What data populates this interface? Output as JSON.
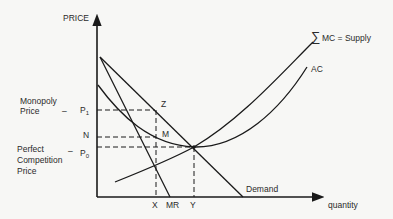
{
  "axes": {
    "y_label": "PRICE",
    "x_label": "quantity"
  },
  "price_labels": {
    "monopoly_line1": "Monopoly",
    "monopoly_line2": "Price",
    "p1": "P",
    "p1_sub": "1",
    "n": "N",
    "perfect_line1": "Perfect",
    "perfect_line2": "Competition",
    "perfect_line3": "Price",
    "p0": "P",
    "p0_sub": "0",
    "dash": "–"
  },
  "point_labels": {
    "z": "Z",
    "m": "M"
  },
  "quantity_labels": {
    "x": "X",
    "mr": "MR",
    "y": "Y"
  },
  "curve_labels": {
    "sigma": "∑",
    "supply": "MC = Supply",
    "ac": "AC",
    "demand": "Demand"
  },
  "colors": {
    "ink": "#1a1a1a",
    "background": "#f7f7f5"
  }
}
